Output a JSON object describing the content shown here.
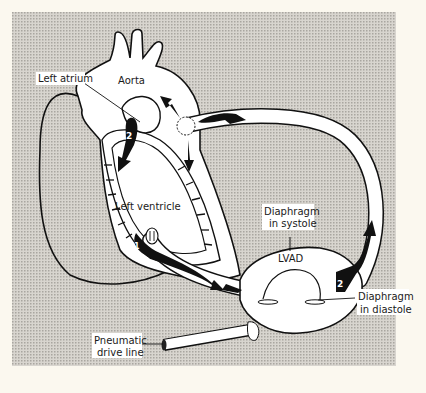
{
  "figure": {
    "background_color": "#fbf8ef",
    "panel_color": "#c9c6c0",
    "labels": {
      "left_atrium": "Left atrium",
      "aorta": "Aorta",
      "left_ventricle": "Left ventricle",
      "diaphragm_systole_1": "Diaphragm",
      "diaphragm_systole_2": "in systole",
      "lvad": "LVAD",
      "diaphragm_diastole_1": "Diaphragm",
      "diaphragm_diastole_2": "in diastole",
      "pneumatic_1": "Pneumatic",
      "pneumatic_2": "drive line"
    },
    "markers": {
      "step_1": "1",
      "step_2_heart": "2",
      "step_2_lvad": "2"
    }
  }
}
